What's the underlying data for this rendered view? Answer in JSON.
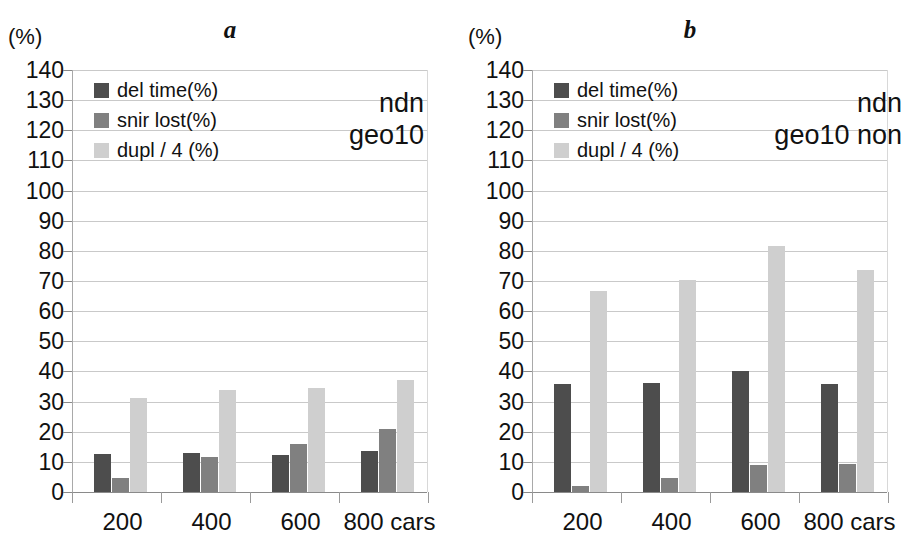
{
  "figure": {
    "width": 920,
    "height": 559,
    "unit_label": "(%)",
    "y_ticks": [
      0,
      10,
      20,
      30,
      40,
      50,
      60,
      70,
      80,
      90,
      100,
      110,
      120,
      130,
      140
    ],
    "y_min": 0,
    "y_max": 140,
    "colors": {
      "del_time": "#4d4d4d",
      "snir_lost": "#808080",
      "dupl": "#cfcfcf",
      "gridline": "#c9c9c9",
      "axis": "#8a8a8a",
      "text": "#111111"
    }
  },
  "panels": [
    {
      "letter": "a",
      "unit_label": "(%)",
      "annotation_lines": [
        "ndn",
        "geo10"
      ],
      "legend": [
        {
          "label": "del time(%)",
          "swatch": "#4d4d4d"
        },
        {
          "label": "snir lost(%)",
          "swatch": "#808080"
        },
        {
          "label": "dupl / 4 (%)",
          "swatch": "#cfcfcf"
        }
      ],
      "x_labels": [
        "200",
        "400",
        "600",
        "800 cars"
      ]
    },
    {
      "letter": "b",
      "unit_label": "(%)",
      "annotation_lines": [
        "ndn",
        "geo10 non"
      ],
      "legend": [
        {
          "label": "del time(%)",
          "swatch": "#4d4d4d"
        },
        {
          "label": "snir lost(%)",
          "swatch": "#808080"
        },
        {
          "label": "dupl / 4 (%)",
          "swatch": "#cfcfcf"
        }
      ],
      "x_labels": [
        "200",
        "400",
        "600",
        "800 cars"
      ]
    }
  ],
  "chart_data": [
    {
      "type": "bar",
      "title": "a",
      "subtitle": "ndn geo10",
      "xlabel": "cars",
      "ylabel": "(%)",
      "ylim": [
        0,
        140
      ],
      "ytick_step": 10,
      "grid": true,
      "legend_position": "top-left",
      "categories": [
        "200",
        "400",
        "600",
        "800"
      ],
      "series": [
        {
          "name": "del time(%)",
          "color": "#4d4d4d",
          "values": [
            12.7,
            13.0,
            12.4,
            13.5
          ]
        },
        {
          "name": "snir lost(%)",
          "color": "#808080",
          "values": [
            4.8,
            11.5,
            15.8,
            20.9
          ]
        },
        {
          "name": "dupl / 4 (%)",
          "color": "#cfcfcf",
          "values": [
            31.2,
            33.8,
            34.5,
            37.3
          ]
        }
      ]
    },
    {
      "type": "bar",
      "title": "b",
      "subtitle": "ndn geo10 non",
      "xlabel": "cars",
      "ylabel": "(%)",
      "ylim": [
        0,
        140
      ],
      "ytick_step": 10,
      "grid": true,
      "legend_position": "top-left",
      "categories": [
        "200",
        "400",
        "600",
        "800"
      ],
      "series": [
        {
          "name": "del time(%)",
          "color": "#4d4d4d",
          "values": [
            35.8,
            36.2,
            40.3,
            36.0
          ]
        },
        {
          "name": "snir lost(%)",
          "color": "#808080",
          "values": [
            2.0,
            4.8,
            9.0,
            9.3
          ]
        },
        {
          "name": "dupl / 4 (%)",
          "color": "#cfcfcf",
          "values": [
            66.8,
            70.3,
            81.6,
            73.6
          ]
        }
      ]
    }
  ]
}
